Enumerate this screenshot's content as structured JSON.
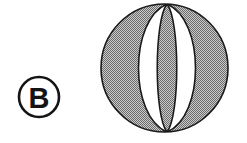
{
  "figure": {
    "id": "figure-b-sphere-meridians",
    "background_color": "#ffffff",
    "width": 247,
    "height": 143,
    "caption_visible": false
  },
  "label": {
    "name": "circled-label-b",
    "letter": "B",
    "shape": "circle",
    "center_x": 39,
    "center_y": 97,
    "radius": 20,
    "stroke_color": "#141414",
    "stroke_width": 2.6,
    "text_color": "#141414",
    "fill_color": "#ffffff"
  },
  "sphere": {
    "name": "sphere-with-meridians",
    "center_x": 164.5,
    "center_y": 68,
    "radius_x": 63.5,
    "radius_y": 64,
    "pole_x": 167,
    "pole_top_y": 4,
    "pole_bottom_y": 132,
    "outline_color": "#1a1a1a",
    "outline_width": 1.6,
    "shaded_fill": "#9a9a9a",
    "unshaded_fill": "#ffffff",
    "fill_style": "halftone-dither",
    "meridian_count": 4,
    "segment_count": 5,
    "shaded_segments": [
      0,
      2,
      4
    ],
    "unshaded_segments": [
      1,
      3
    ],
    "meridian_half_widths": [
      38,
      13,
      13,
      38
    ],
    "meridian_directions": [
      "left",
      "left",
      "right",
      "right"
    ]
  }
}
